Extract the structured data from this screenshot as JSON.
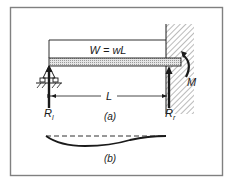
{
  "figure": {
    "part_a": {
      "load_label": "W = wL",
      "span_label": "L",
      "moment_label": "M",
      "left_reaction": {
        "main": "R",
        "sub": "l"
      },
      "right_reaction": {
        "main": "R",
        "sub": "r"
      },
      "caption": "(a)"
    },
    "part_b": {
      "caption": "(b)"
    }
  },
  "colors": {
    "ink": "#1a1a1a",
    "frame": "#808080",
    "beam_fill": "#d8d8d8"
  }
}
